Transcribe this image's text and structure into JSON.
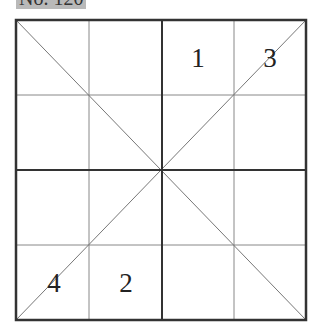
{
  "header": {
    "label": "No. 120",
    "label_note": "top of text cropped in screenshot; reading is partial"
  },
  "grid": {
    "rows": 4,
    "cols": 4,
    "line_color": "#333333",
    "thin_line_color": "#777777",
    "diagonals": true
  },
  "cells": [
    {
      "row": 0,
      "col": 2,
      "value": "1"
    },
    {
      "row": 0,
      "col": 3,
      "value": "3"
    },
    {
      "row": 3,
      "col": 0,
      "value": "4"
    },
    {
      "row": 3,
      "col": 1,
      "value": "2"
    }
  ],
  "numbers": {
    "n1": "1",
    "n3": "3",
    "n4": "4",
    "n2": "2"
  }
}
